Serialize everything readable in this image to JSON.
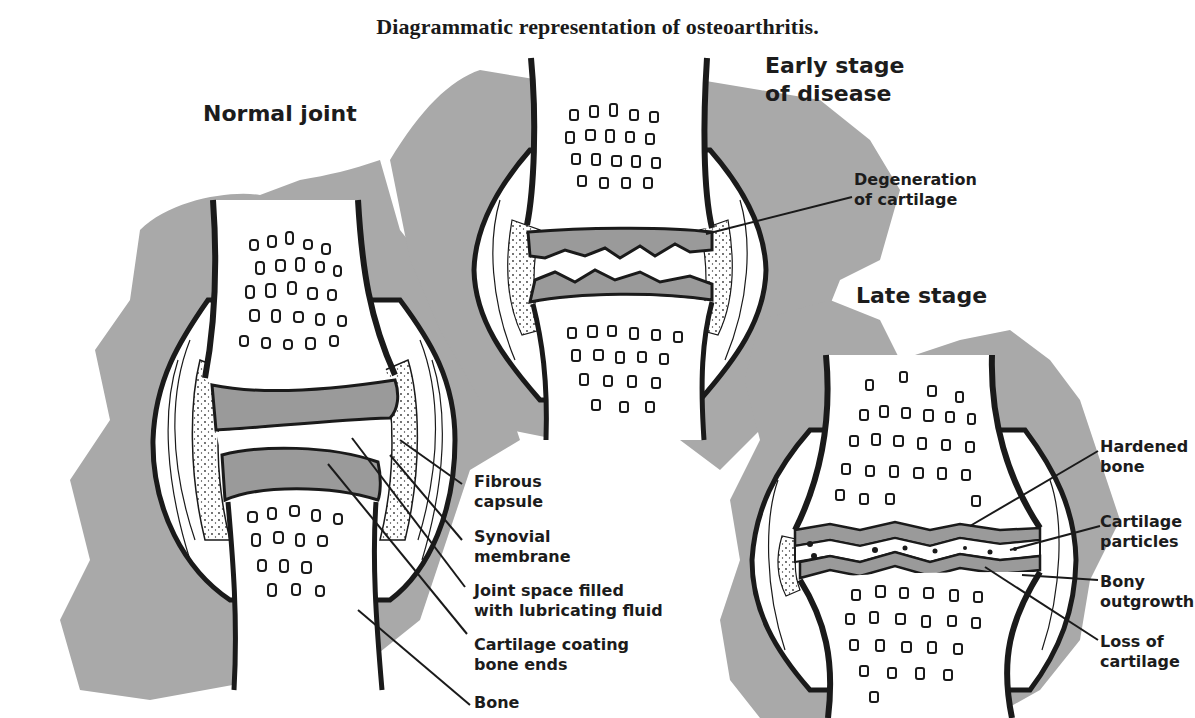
{
  "title": "Diagrammatic representation of osteoarthritis.",
  "colors": {
    "background_blob": "#a9a9a9",
    "cartilage": "#9a9a9a",
    "outline": "#1a1a1a",
    "bone": "#ffffff"
  },
  "panels": {
    "normal": {
      "heading": "Normal joint",
      "labels": [
        {
          "line1": "Fibrous",
          "line2": "capsule"
        },
        {
          "line1": "Synovial",
          "line2": "membrane"
        },
        {
          "line1": "Joint space filled",
          "line2": "with lubricating fluid"
        },
        {
          "line1": "Cartilage coating",
          "line2": "bone ends"
        },
        {
          "line1": "Bone",
          "line2": ""
        }
      ]
    },
    "early": {
      "heading_line1": "Early stage",
      "heading_line2": "of disease",
      "labels": [
        {
          "line1": "Degeneration",
          "line2": "of cartilage"
        }
      ]
    },
    "late": {
      "heading": "Late stage",
      "labels": [
        {
          "line1": "Hardened",
          "line2": "bone"
        },
        {
          "line1": "Cartilage",
          "line2": "particles"
        },
        {
          "line1": "Bony",
          "line2": "outgrowth"
        },
        {
          "line1": "Loss of",
          "line2": "cartilage"
        }
      ]
    }
  }
}
